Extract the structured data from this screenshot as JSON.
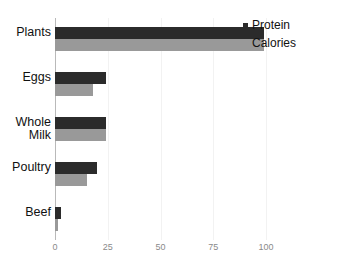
{
  "chart_data": {
    "type": "bar",
    "orientation": "horizontal",
    "title": "",
    "xlabel": "",
    "ylabel": "",
    "categories": [
      "Plants",
      "Whole\nMilk",
      "Eggs",
      "Poultry",
      "Beef"
    ],
    "category_order_top_to_bottom": [
      "Plants",
      "Eggs",
      "Whole Milk",
      "Poultry",
      "Beef"
    ],
    "series": [
      {
        "name": "Protein",
        "color": "#2b2b2b",
        "values": [
          99,
          24,
          24,
          20,
          3
        ]
      },
      {
        "name": "Calories",
        "color": "#999999",
        "values": [
          99,
          18,
          24,
          15,
          1.5
        ]
      }
    ],
    "xlim": [
      0,
      110
    ],
    "xticks": [
      0,
      25,
      50,
      75,
      100
    ],
    "xtick_labels": [
      "0",
      "25",
      "50",
      "75",
      "100"
    ],
    "grid": true,
    "grid_axis": "x",
    "legend_position": "top-right"
  },
  "rows": [
    {
      "label": "Plants",
      "label_lines": "Plants",
      "protein": 99,
      "calories": 99
    },
    {
      "label": "Eggs",
      "label_lines": "Eggs",
      "protein": 24,
      "calories": 18
    },
    {
      "label": "Whole Milk",
      "label_lines": "Whole\nMilk",
      "protein": 24,
      "calories": 24
    },
    {
      "label": "Poultry",
      "label_lines": "Poultry",
      "protein": 20,
      "calories": 15
    },
    {
      "label": "Beef",
      "label_lines": "Beef",
      "protein": 3,
      "calories": 1.5
    }
  ],
  "legend": {
    "items": [
      {
        "label": "Protein",
        "color": "#2b2b2b"
      },
      {
        "label": "Calories",
        "color": "#999999"
      }
    ]
  },
  "axis": {
    "ticks": [
      {
        "label": "0",
        "value": 0
      },
      {
        "label": "25",
        "value": 25
      },
      {
        "label": "50",
        "value": 50
      },
      {
        "label": "75",
        "value": 75
      },
      {
        "label": "100",
        "value": 100
      }
    ],
    "line_color": "#b9b9b9",
    "grid_color": "#f2f2f2",
    "tick_label_color": "#8a8a8a"
  }
}
